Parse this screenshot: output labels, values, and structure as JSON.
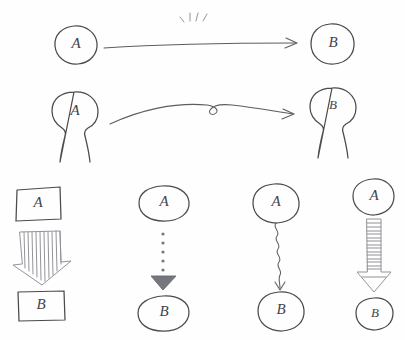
{
  "diagram": {
    "medium": "hand-drawn pencil sketch",
    "background_color": "#fefefe",
    "ink_color": "#4a4a4f",
    "width": 405,
    "height": 340
  },
  "rows": [
    {
      "id": "row-circle-straight",
      "source": {
        "label": "A",
        "shape": "circle"
      },
      "target": {
        "label": "B",
        "shape": "circle"
      },
      "connector": {
        "style": "straight-line",
        "arrowhead": "open-v",
        "direction": "left-to-right"
      },
      "annotation": {
        "name": "sparkle-marks",
        "kind": "emphasis-ticks",
        "count": 4
      }
    },
    {
      "id": "row-person-curved",
      "source": {
        "label": "A",
        "shape": "person"
      },
      "target": {
        "label": "B",
        "shape": "person"
      },
      "connector": {
        "style": "curved-line-with-loop",
        "arrowhead": "open-v",
        "direction": "left-to-right"
      }
    }
  ],
  "columns": [
    {
      "id": "col-striped-block",
      "source": {
        "label": "A",
        "shape": "rectangle"
      },
      "target": {
        "label": "B",
        "shape": "rectangle"
      },
      "connector": {
        "style": "wide-block-arrow-vertical-stripes",
        "arrowhead": "block-triangle",
        "direction": "top-to-bottom",
        "stripe_count": 10
      }
    },
    {
      "id": "col-dotted",
      "source": {
        "label": "A",
        "shape": "oval"
      },
      "target": {
        "label": "B",
        "shape": "oval"
      },
      "connector": {
        "style": "dotted-line",
        "arrowhead": "solid-triangle",
        "direction": "top-to-bottom",
        "dot_count": 5
      }
    },
    {
      "id": "col-wavy",
      "source": {
        "label": "A",
        "shape": "circle"
      },
      "target": {
        "label": "B",
        "shape": "circle"
      },
      "connector": {
        "style": "wavy-squiggle-line",
        "arrowhead": "thin-open-v",
        "direction": "top-to-bottom"
      }
    },
    {
      "id": "col-ridged-block",
      "source": {
        "label": "A",
        "shape": "circle"
      },
      "target": {
        "label": "B",
        "shape": "circle-small"
      },
      "connector": {
        "style": "narrow-block-arrow-horizontal-rungs",
        "arrowhead": "outlined-triangle",
        "direction": "top-to-bottom",
        "rung_count": 15
      }
    }
  ]
}
